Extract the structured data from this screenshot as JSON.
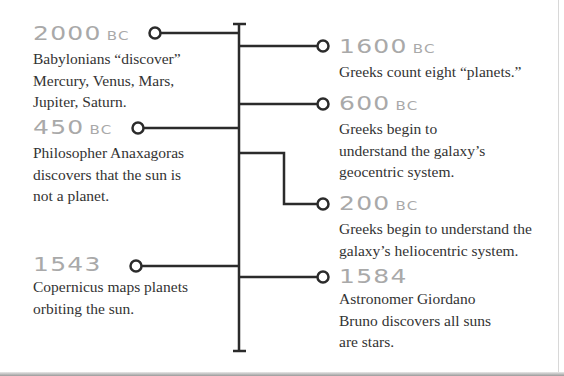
{
  "timeline": {
    "colors": {
      "line": "#2b2b2b",
      "year": "#a9a9a9",
      "text": "#333333"
    },
    "left_events": [
      {
        "year": "2000",
        "era": "BC",
        "description_lines": [
          "Babylonians “discover”",
          "Mercury, Venus, Mars,",
          "Jupiter, Saturn."
        ]
      },
      {
        "year": "450",
        "era": "BC",
        "description_lines": [
          "Philosopher Anaxagoras",
          "discovers that the sun is",
          "not a planet."
        ]
      },
      {
        "year": "1543",
        "era": "",
        "description_lines": [
          "Copernicus maps planets",
          "orbiting the sun."
        ]
      }
    ],
    "right_events": [
      {
        "year": "1600",
        "era": "BC",
        "description_lines": [
          "Greeks count eight “planets.”"
        ]
      },
      {
        "year": "600",
        "era": "BC",
        "description_lines": [
          "Greeks begin to",
          "understand the galaxy’s",
          "geocentric system."
        ]
      },
      {
        "year": "200",
        "era": "BC",
        "description_lines": [
          "Greeks begin to understand the",
          "galaxy’s heliocentric system."
        ]
      },
      {
        "year": "1584",
        "era": "",
        "description_lines": [
          "Astronomer Giordano",
          "Bruno discovers all suns",
          "are stars."
        ]
      }
    ]
  }
}
